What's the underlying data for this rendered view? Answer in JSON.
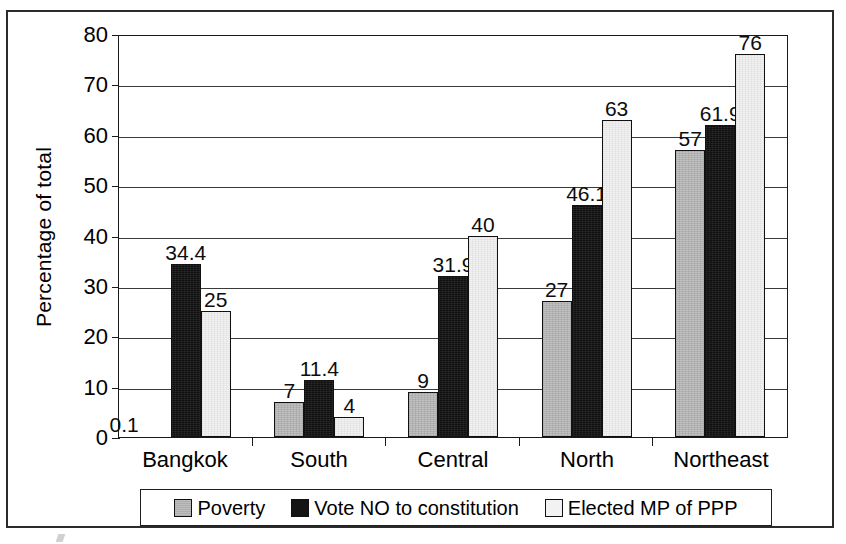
{
  "chart_data": {
    "type": "bar",
    "title": "",
    "xlabel": "",
    "ylabel": "Percentage of total",
    "ylim": [
      0,
      80
    ],
    "ytick_step": 10,
    "yticks": [
      "80",
      "70",
      "60",
      "50",
      "40",
      "30",
      "20",
      "10",
      "0"
    ],
    "grid": true,
    "legend_position": "bottom",
    "categories": [
      "Bangkok",
      "South",
      "Central",
      "North",
      "Northeast"
    ],
    "series": [
      {
        "name": "Poverty",
        "color": "#b9b9b9",
        "values": [
          0.1,
          7,
          9,
          27,
          57
        ],
        "labels": [
          "0.1",
          "7",
          "9",
          "27",
          "57"
        ]
      },
      {
        "name": "Vote NO to constitution",
        "color": "#141414",
        "values": [
          34.4,
          11.4,
          31.9,
          46.1,
          61.9
        ],
        "labels": [
          "34.4",
          "11.4",
          "31.9",
          "46.1",
          "61.9"
        ]
      },
      {
        "name": "Elected MP of PPP",
        "color": "#f0f0f0",
        "values": [
          25,
          4,
          40,
          63,
          76
        ],
        "labels": [
          "25",
          "4",
          "40",
          "63",
          "76"
        ]
      }
    ]
  },
  "legend": {
    "items": [
      {
        "label": "Poverty"
      },
      {
        "label": "Vote NO to constitution"
      },
      {
        "label": "Elected MP of PPP"
      }
    ]
  }
}
